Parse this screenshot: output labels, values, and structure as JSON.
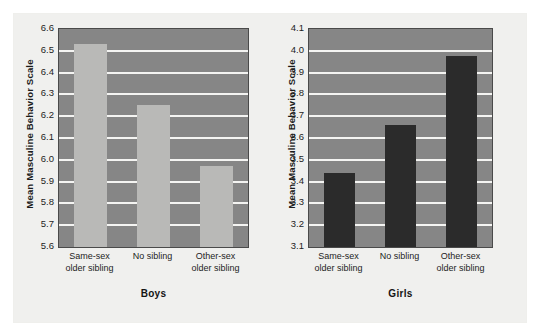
{
  "figure": {
    "background_color": "#f0f0ee",
    "plot_background_color": "#868686",
    "gridline_color": "#f4f4f2",
    "panels": [
      {
        "key": "boys",
        "caption": "Boys",
        "bar_color": "#b9b9b7"
      },
      {
        "key": "girls",
        "caption": "Girls",
        "bar_color": "#2b2b2b"
      }
    ]
  },
  "chart_data": [
    {
      "type": "bar",
      "title": "Boys",
      "xlabel": "Boys",
      "ylabel": "Mean Masculine Behavior Scale",
      "categories": [
        "Same-sex older sibling",
        "No sibling",
        "Other-sex older sibling"
      ],
      "category_lines": [
        [
          "Same-sex",
          "older sibling"
        ],
        [
          "No sibling",
          ""
        ],
        [
          "Other-sex",
          "older sibling"
        ]
      ],
      "values": [
        6.53,
        6.25,
        5.97
      ],
      "ylim": [
        5.6,
        6.6
      ],
      "ytick_step": 0.1,
      "yticks": [
        "6.6",
        "6.5",
        "6.4",
        "6.3",
        "6.2",
        "6.1",
        "6.0",
        "5.9",
        "5.8",
        "5.7",
        "5.6"
      ],
      "ytick_values": [
        6.6,
        6.5,
        6.4,
        6.3,
        6.2,
        6.1,
        6.0,
        5.9,
        5.8,
        5.7,
        5.6
      ],
      "grid": true,
      "legend": false,
      "bar_color": "#b9b9b7"
    },
    {
      "type": "bar",
      "title": "Girls",
      "xlabel": "Girls",
      "ylabel": "Mean Masculine Behavior Scale",
      "categories": [
        "Same-sex older sibling",
        "No sibling",
        "Other-sex older sibling"
      ],
      "category_lines": [
        [
          "Same-sex",
          "older sibling"
        ],
        [
          "No sibling",
          ""
        ],
        [
          "Other-sex",
          "older sibling"
        ]
      ],
      "values": [
        3.44,
        3.66,
        3.975
      ],
      "ylim": [
        3.1,
        4.1
      ],
      "ytick_step": 0.1,
      "yticks": [
        "4.1",
        "4.0",
        "3.9",
        "3.8",
        "3.7",
        "3.6",
        "3.5",
        "3.4",
        "3.3",
        "3.2",
        "3.1"
      ],
      "ytick_values": [
        4.1,
        4.0,
        3.9,
        3.8,
        3.7,
        3.6,
        3.5,
        3.4,
        3.3,
        3.2,
        3.1
      ],
      "grid": true,
      "legend": false,
      "bar_color": "#2b2b2b"
    }
  ]
}
